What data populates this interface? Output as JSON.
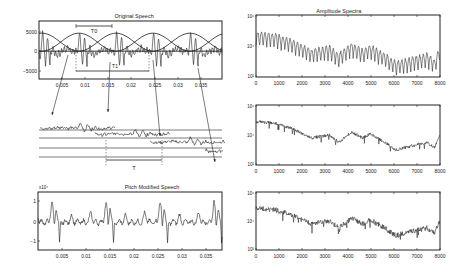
{
  "chart_data": [
    {
      "type": "line",
      "title": "Original Speech",
      "xlabel": "",
      "ylabel": "",
      "x_ticks": [
        "0.005",
        "0.01",
        "0.015",
        "0.02",
        "0.025",
        "0.03",
        "0.035"
      ],
      "y_ticks": [
        "5000",
        "0",
        "-5000"
      ],
      "ylim": [
        -8000,
        7000
      ],
      "xlim": [
        0,
        0.037
      ],
      "annotations": [
        "T0",
        "T1"
      ],
      "overlays": "overlapping Hanning analysis windows centered at pitch marks",
      "grid": false
    },
    {
      "type": "line",
      "title": "",
      "description": "Pitch-synchronous segments extracted at pitch marks and overlap-added with new spacing",
      "annotations": [
        "T"
      ],
      "segments": 4
    },
    {
      "type": "line",
      "title": "Pitch Modified Speech",
      "x_ticks": [
        "0.005",
        "0.01",
        "0.015",
        "0.02",
        "0.025",
        "0.03",
        "0.035"
      ],
      "y_ticks": [
        "1",
        "0",
        "-1"
      ],
      "y_multiplier": "x10^4",
      "ylim": [
        -1.3,
        1.4
      ],
      "xlim": [
        0,
        0.037
      ],
      "grid": false
    },
    {
      "type": "line",
      "title": "Amplitude Spectra",
      "x_ticks": [
        "0",
        "1000",
        "2000",
        "3000",
        "4000",
        "5000",
        "6000",
        "7000",
        "8000"
      ],
      "y_ticks": [
        "10^6",
        "10^4",
        "10^2"
      ],
      "yscale": "log",
      "xlim": [
        0,
        8000
      ],
      "ylim": [
        100,
        1000000
      ],
      "grid": false,
      "description": "Harmonic-rich spectrum of original speech"
    },
    {
      "type": "line",
      "title": "",
      "x_ticks": [
        "0",
        "1000",
        "2000",
        "3000",
        "4000",
        "5000",
        "6000",
        "7000",
        "8000"
      ],
      "y_ticks": [
        "10^6",
        "10^4",
        "10^2"
      ],
      "yscale": "log",
      "xlim": [
        0,
        8000
      ],
      "ylim": [
        100,
        1000000
      ],
      "description": "Spectral envelope of windowed segment"
    },
    {
      "type": "line",
      "title": "",
      "x_ticks": [
        "0",
        "1000",
        "2000",
        "3000",
        "4000",
        "5000",
        "6000",
        "7000",
        "8000"
      ],
      "y_ticks": [
        "10^6",
        "10^4",
        "10^2"
      ],
      "yscale": "log",
      "xlim": [
        0,
        8000
      ],
      "ylim": [
        100,
        1000000
      ],
      "description": "Spectrum of pitch-modified speech"
    }
  ],
  "labels": {
    "tl_title": "Original Speech",
    "tr_title": "Amplitude Spectra",
    "bl_title": "Pitch Modified Speech",
    "t0": "T0",
    "t1": "T1",
    "t": "T",
    "bl_mult": "x10⁴",
    "time_ticks": [
      "0.005",
      "0.01",
      "0.015",
      "0.02",
      "0.025",
      "0.03",
      "0.035"
    ],
    "tl_yticks": [
      "5000",
      "0",
      "−5000"
    ],
    "bl_yticks": [
      "1",
      "0",
      "−1"
    ],
    "freq_ticks": [
      "0",
      "1000",
      "2000",
      "3000",
      "4000",
      "5000",
      "6000",
      "7000",
      "8000"
    ],
    "log_ticks": [
      "10⁶",
      "10⁴",
      "10²"
    ]
  }
}
